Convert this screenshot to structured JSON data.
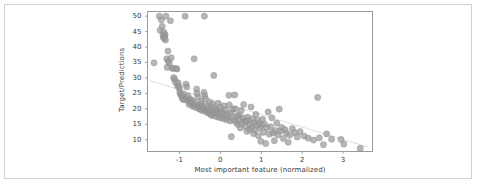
{
  "figure": {
    "background_color": "#ffffff",
    "border_color": "#d0d0d0",
    "plot_frame_color": "#9a9a9a"
  },
  "chart_data": {
    "type": "scatter",
    "title": "",
    "xlabel": "Most important feature (normalized)",
    "ylabel": "Target/Predictions",
    "xlim": [
      -1.78,
      3.72
    ],
    "ylim": [
      6.2,
      51.5
    ],
    "xticks": [
      -1,
      0,
      1,
      2,
      3
    ],
    "xticklabels": [
      "-1",
      "0",
      "1",
      "2",
      "3"
    ],
    "yticks": [
      10,
      15,
      20,
      25,
      30,
      35,
      40,
      45,
      50
    ],
    "yticklabels": [
      "10",
      "15",
      "20",
      "25",
      "30",
      "35",
      "40",
      "45",
      "50"
    ],
    "grid": false,
    "legend": null,
    "marker": {
      "color": "#9a9a9a",
      "edge_color": "#8c8c8c",
      "size": 3.1,
      "opacity": 0.72,
      "shape": "circle"
    },
    "trendline": {
      "color": "#d9d9d9",
      "width": 0.9,
      "x": [
        -1.72,
        3.62
      ],
      "y": [
        29.1,
        7.6
      ]
    },
    "points": [
      [
        -1.62,
        34.9
      ],
      [
        -1.49,
        50.0
      ],
      [
        -1.47,
        45.4
      ],
      [
        -1.44,
        48.8
      ],
      [
        -1.42,
        46.7
      ],
      [
        -1.4,
        43.8
      ],
      [
        -1.39,
        43.1
      ],
      [
        -1.38,
        44.8
      ],
      [
        -1.37,
        42.8
      ],
      [
        -1.36,
        43.5
      ],
      [
        -1.35,
        44.0
      ],
      [
        -1.34,
        42.3
      ],
      [
        -1.33,
        50.0
      ],
      [
        -1.31,
        36.2
      ],
      [
        -1.3,
        33.4
      ],
      [
        -1.28,
        38.7
      ],
      [
        -1.27,
        35.4
      ],
      [
        -1.25,
        34.9
      ],
      [
        -1.22,
        48.5
      ],
      [
        -1.2,
        36.5
      ],
      [
        -1.18,
        33.2
      ],
      [
        -1.16,
        33.1
      ],
      [
        -1.14,
        30.1
      ],
      [
        -1.12,
        29.6
      ],
      [
        -1.1,
        28.7
      ],
      [
        -1.08,
        33.0
      ],
      [
        -1.06,
        32.9
      ],
      [
        -1.05,
        27.5
      ],
      [
        -1.03,
        28.4
      ],
      [
        -1.01,
        27.1
      ],
      [
        -1.0,
        26.6
      ],
      [
        -0.99,
        25.3
      ],
      [
        -0.97,
        24.7
      ],
      [
        -0.95,
        24.4
      ],
      [
        -0.94,
        23.9
      ],
      [
        -0.92,
        23.1
      ],
      [
        -0.9,
        24.8
      ],
      [
        -0.89,
        23.3
      ],
      [
        -0.87,
        22.9
      ],
      [
        -0.86,
        50.0
      ],
      [
        -0.84,
        28.0
      ],
      [
        -0.82,
        27.1
      ],
      [
        -0.8,
        23.4
      ],
      [
        -0.79,
        24.2
      ],
      [
        -0.77,
        22.2
      ],
      [
        -0.76,
        21.4
      ],
      [
        -0.74,
        22.8
      ],
      [
        -0.72,
        23.0
      ],
      [
        -0.71,
        21.9
      ],
      [
        -0.69,
        22.6
      ],
      [
        -0.67,
        20.8
      ],
      [
        -0.66,
        21.7
      ],
      [
        -0.64,
        36.2
      ],
      [
        -0.63,
        22.0
      ],
      [
        -0.61,
        21.2
      ],
      [
        -0.6,
        20.4
      ],
      [
        -0.58,
        26.4
      ],
      [
        -0.57,
        25.0
      ],
      [
        -0.55,
        23.8
      ],
      [
        -0.54,
        21.0
      ],
      [
        -0.52,
        20.6
      ],
      [
        -0.51,
        19.9
      ],
      [
        -0.49,
        20.1
      ],
      [
        -0.47,
        22.5
      ],
      [
        -0.46,
        21.6
      ],
      [
        -0.45,
        20.9
      ],
      [
        -0.44,
        19.4
      ],
      [
        -0.43,
        19.8
      ],
      [
        -0.41,
        20.3
      ],
      [
        -0.4,
        25.3
      ],
      [
        -0.39,
        50.0
      ],
      [
        -0.38,
        24.3
      ],
      [
        -0.36,
        23.2
      ],
      [
        -0.35,
        19.6
      ],
      [
        -0.34,
        18.9
      ],
      [
        -0.32,
        21.1
      ],
      [
        -0.3,
        19.1
      ],
      [
        -0.29,
        20.2
      ],
      [
        -0.27,
        18.5
      ],
      [
        -0.26,
        22.1
      ],
      [
        -0.25,
        19.3
      ],
      [
        -0.23,
        18.2
      ],
      [
        -0.21,
        20.7
      ],
      [
        -0.2,
        17.8
      ],
      [
        -0.18,
        21.5
      ],
      [
        -0.16,
        30.8
      ],
      [
        -0.15,
        19.0
      ],
      [
        -0.13,
        18.7
      ],
      [
        -0.12,
        20.0
      ],
      [
        -0.1,
        17.5
      ],
      [
        -0.08,
        19.5
      ],
      [
        -0.06,
        18.4
      ],
      [
        -0.05,
        21.8
      ],
      [
        -0.03,
        17.2
      ],
      [
        -0.01,
        20.5
      ],
      [
        0.01,
        18.1
      ],
      [
        0.03,
        19.2
      ],
      [
        0.05,
        16.9
      ],
      [
        0.07,
        18.6
      ],
      [
        0.09,
        20.9
      ],
      [
        0.11,
        17.0
      ],
      [
        0.13,
        19.7
      ],
      [
        0.15,
        16.5
      ],
      [
        0.17,
        18.3
      ],
      [
        0.19,
        17.6
      ],
      [
        0.21,
        24.4
      ],
      [
        0.22,
        21.3
      ],
      [
        0.24,
        16.1
      ],
      [
        0.26,
        18.8
      ],
      [
        0.27,
        11.0
      ],
      [
        0.29,
        17.4
      ],
      [
        0.31,
        19.9
      ],
      [
        0.33,
        16.3
      ],
      [
        0.35,
        24.5
      ],
      [
        0.37,
        20.0
      ],
      [
        0.39,
        15.6
      ],
      [
        0.41,
        17.7
      ],
      [
        0.43,
        14.9
      ],
      [
        0.45,
        18.0
      ],
      [
        0.47,
        16.7
      ],
      [
        0.49,
        13.8
      ],
      [
        0.51,
        19.4
      ],
      [
        0.53,
        15.2
      ],
      [
        0.55,
        17.1
      ],
      [
        0.57,
        21.4
      ],
      [
        0.59,
        16.0
      ],
      [
        0.61,
        14.4
      ],
      [
        0.63,
        15.9
      ],
      [
        0.65,
        12.7
      ],
      [
        0.67,
        17.3
      ],
      [
        0.69,
        16.2
      ],
      [
        0.71,
        13.4
      ],
      [
        0.73,
        15.0
      ],
      [
        0.75,
        20.6
      ],
      [
        0.77,
        14.1
      ],
      [
        0.79,
        16.8
      ],
      [
        0.81,
        12.0
      ],
      [
        0.83,
        15.5
      ],
      [
        0.85,
        13.1
      ],
      [
        0.87,
        18.2
      ],
      [
        0.89,
        14.7
      ],
      [
        0.91,
        16.4
      ],
      [
        0.93,
        11.3
      ],
      [
        0.95,
        15.3
      ],
      [
        0.97,
        13.7
      ],
      [
        0.99,
        9.5
      ],
      [
        1.01,
        14.6
      ],
      [
        1.03,
        16.6
      ],
      [
        1.06,
        12.4
      ],
      [
        1.08,
        15.1
      ],
      [
        1.11,
        8.8
      ],
      [
        1.14,
        13.9
      ],
      [
        1.17,
        19.0
      ],
      [
        1.2,
        11.8
      ],
      [
        1.23,
        14.2
      ],
      [
        1.26,
        17.1
      ],
      [
        1.29,
        12.2
      ],
      [
        1.32,
        9.7
      ],
      [
        1.35,
        13.0
      ],
      [
        1.38,
        15.4
      ],
      [
        1.41,
        11.6
      ],
      [
        1.44,
        19.9
      ],
      [
        1.47,
        12.8
      ],
      [
        1.5,
        14.0
      ],
      [
        1.54,
        10.4
      ],
      [
        1.58,
        13.3
      ],
      [
        1.62,
        12.1
      ],
      [
        1.66,
        9.2
      ],
      [
        1.7,
        11.5
      ],
      [
        1.76,
        13.6
      ],
      [
        1.82,
        12.3
      ],
      [
        1.88,
        10.9
      ],
      [
        1.95,
        12.6
      ],
      [
        2.05,
        11.2
      ],
      [
        2.15,
        10.5
      ],
      [
        2.28,
        9.9
      ],
      [
        2.38,
        23.7
      ],
      [
        2.42,
        10.6
      ],
      [
        2.52,
        8.4
      ],
      [
        2.6,
        11.9
      ],
      [
        2.72,
        10.2
      ],
      [
        2.95,
        10.1
      ],
      [
        3.02,
        8.6
      ],
      [
        3.42,
        7.2
      ]
    ]
  }
}
